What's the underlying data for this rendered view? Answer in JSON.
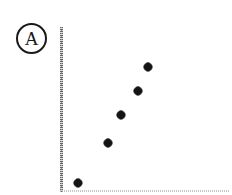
{
  "figure": {
    "panel_label": "A",
    "width": 232,
    "height": 195,
    "background_color": "#ffffff",
    "marker_color": "#141414",
    "axis_color": "#5a5a5a",
    "xaxis_color": "#bdbdbd"
  },
  "chart_data": {
    "type": "scatter",
    "title": "",
    "subtitle": "",
    "xlabel": "",
    "ylabel": "",
    "annotations": [
      "A"
    ],
    "legend": [],
    "legend_position": "none",
    "grid": false,
    "xlim": [
      0,
      10
    ],
    "ylim": [
      0,
      10
    ],
    "xticks": [],
    "yticks": [],
    "xticklabels": [],
    "yticklabels": [],
    "series": [
      {
        "name": "series-1",
        "marker": "diamond",
        "color": "#141414",
        "points": [
          {
            "x": 1.06,
            "y": 0.49,
            "px": 78,
            "py": 183
          },
          {
            "x": 2.82,
            "y": 2.93,
            "px": 108,
            "py": 143
          },
          {
            "x": 3.59,
            "y": 4.63,
            "px": 121,
            "py": 115
          },
          {
            "x": 4.59,
            "y": 6.1,
            "px": 138,
            "py": 91
          },
          {
            "x": 5.18,
            "y": 7.56,
            "px": 148,
            "py": 67
          }
        ]
      }
    ]
  }
}
